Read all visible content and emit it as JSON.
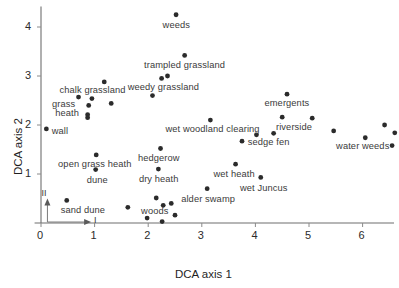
{
  "chart_data": {
    "type": "scatter",
    "title": "",
    "xlabel": "DCA axis 1",
    "ylabel": "DCA axis 2",
    "xlim": [
      -0.12,
      6.6
    ],
    "ylim": [
      -0.12,
      4.45
    ],
    "xticks": [
      0,
      1,
      2,
      3,
      4,
      5,
      6
    ],
    "xticklabels": [
      "0",
      "1",
      "2",
      "3",
      "4",
      "5",
      "6"
    ],
    "yticks": [
      1,
      2,
      3,
      4
    ],
    "yticklabels": [
      "1",
      "2",
      "3",
      "4"
    ],
    "grid": false,
    "legend": null,
    "marker": "circle",
    "marker_color": "#2b2b2b",
    "inset_axes": {
      "axis_i_label": "I",
      "axis_ii_label": "II"
    },
    "points": [
      {
        "x": 2.52,
        "y": 4.25,
        "label": "weeds"
      },
      {
        "x": 2.68,
        "y": 3.42,
        "label": "trampled grassland"
      },
      {
        "x": 2.25,
        "y": 2.95,
        "label": ""
      },
      {
        "x": 2.36,
        "y": 3.0,
        "label": "weedy grassland"
      },
      {
        "x": 2.08,
        "y": 2.6,
        "label": ""
      },
      {
        "x": 1.18,
        "y": 2.88,
        "label": ""
      },
      {
        "x": 0.7,
        "y": 2.57,
        "label": "chalk grassland"
      },
      {
        "x": 0.95,
        "y": 2.54,
        "label": ""
      },
      {
        "x": 1.31,
        "y": 2.44,
        "label": ""
      },
      {
        "x": 0.89,
        "y": 2.4,
        "label": "grass heath"
      },
      {
        "x": 0.87,
        "y": 2.21,
        "label": ""
      },
      {
        "x": 0.87,
        "y": 2.15,
        "label": ""
      },
      {
        "x": 0.1,
        "y": 1.92,
        "label": "wall"
      },
      {
        "x": 3.16,
        "y": 2.1,
        "label": "wet woodland clearing"
      },
      {
        "x": 4.59,
        "y": 2.63,
        "label": "emergents"
      },
      {
        "x": 4.5,
        "y": 2.16,
        "label": "riverside"
      },
      {
        "x": 5.06,
        "y": 2.14,
        "label": ""
      },
      {
        "x": 3.75,
        "y": 1.67,
        "label": ""
      },
      {
        "x": 4.02,
        "y": 1.8,
        "label": "sedge fen"
      },
      {
        "x": 4.34,
        "y": 1.83,
        "label": ""
      },
      {
        "x": 5.46,
        "y": 1.88,
        "label": ""
      },
      {
        "x": 6.05,
        "y": 1.74,
        "label": "water weeds"
      },
      {
        "x": 6.41,
        "y": 2.0,
        "label": ""
      },
      {
        "x": 6.6,
        "y": 1.84,
        "label": ""
      },
      {
        "x": 6.55,
        "y": 1.58,
        "label": ""
      },
      {
        "x": 2.23,
        "y": 1.52,
        "label": "hedgerow"
      },
      {
        "x": 1.03,
        "y": 1.39,
        "label": "open grass heath"
      },
      {
        "x": 1.02,
        "y": 1.09,
        "label": "dune"
      },
      {
        "x": 2.19,
        "y": 1.1,
        "label": "dry heath"
      },
      {
        "x": 3.63,
        "y": 1.2,
        "label": "wet heath"
      },
      {
        "x": 4.1,
        "y": 0.93,
        "label": "wet Juncus"
      },
      {
        "x": 3.1,
        "y": 0.7,
        "label": "alder swamp"
      },
      {
        "x": 0.48,
        "y": 0.46,
        "label": "sand dune"
      },
      {
        "x": 1.62,
        "y": 0.32,
        "label": ""
      },
      {
        "x": 2.15,
        "y": 0.51,
        "label": ""
      },
      {
        "x": 2.28,
        "y": 0.36,
        "label": ""
      },
      {
        "x": 2.43,
        "y": 0.4,
        "label": ""
      },
      {
        "x": 2.5,
        "y": 0.16,
        "label": "woods"
      },
      {
        "x": 2.26,
        "y": 0.03,
        "label": ""
      },
      {
        "x": 1.98,
        "y": 0.1,
        "label": ""
      }
    ],
    "point_labels": [
      {
        "text": "weeds",
        "x": 2.52,
        "y": 4.05,
        "anchor": "middle"
      },
      {
        "text": "trampled grassland",
        "x": 2.68,
        "y": 3.22,
        "anchor": "middle"
      },
      {
        "text": "weedy grassland",
        "x": 2.28,
        "y": 2.78,
        "anchor": "middle"
      },
      {
        "text": "chalk grassland",
        "x": 0.96,
        "y": 2.72,
        "anchor": "middle"
      },
      {
        "text": "grass",
        "x": 0.42,
        "y": 2.42,
        "anchor": "middle"
      },
      {
        "text": "heath",
        "x": 0.49,
        "y": 2.25,
        "anchor": "middle"
      },
      {
        "text": "wall",
        "x": 0.2,
        "y": 1.88,
        "anchor": "start"
      },
      {
        "text": "wet woodland clearing",
        "x": 3.2,
        "y": 1.92,
        "anchor": "middle"
      },
      {
        "text": "emergents",
        "x": 4.59,
        "y": 2.45,
        "anchor": "middle"
      },
      {
        "text": "riverside",
        "x": 4.72,
        "y": 1.97,
        "anchor": "middle"
      },
      {
        "text": "sedge fen",
        "x": 4.25,
        "y": 1.65,
        "anchor": "middle"
      },
      {
        "text": "water weeds",
        "x": 6.0,
        "y": 1.58,
        "anchor": "middle"
      },
      {
        "text": "hedgerow",
        "x": 2.2,
        "y": 1.33,
        "anchor": "middle"
      },
      {
        "text": "open grass heath",
        "x": 1.0,
        "y": 1.2,
        "anchor": "middle"
      },
      {
        "text": "dune",
        "x": 1.05,
        "y": 0.88,
        "anchor": "middle"
      },
      {
        "text": "dry heath",
        "x": 2.2,
        "y": 0.9,
        "anchor": "middle"
      },
      {
        "text": "wet heath",
        "x": 3.6,
        "y": 1.0,
        "anchor": "middle"
      },
      {
        "text": "wet Juncus",
        "x": 4.16,
        "y": 0.72,
        "anchor": "middle"
      },
      {
        "text": "alder swamp",
        "x": 3.12,
        "y": 0.5,
        "anchor": "middle"
      },
      {
        "text": "sand dune",
        "x": 0.78,
        "y": 0.27,
        "anchor": "middle"
      },
      {
        "text": "woods",
        "x": 2.12,
        "y": 0.24,
        "anchor": "middle"
      }
    ]
  },
  "axes": {
    "x_title": "DCA axis 1",
    "y_title": "DCA axis 2",
    "x_tick_labels": [
      "0",
      "1",
      "2",
      "3",
      "4",
      "5",
      "6"
    ],
    "y_tick_labels": [
      "1",
      "2",
      "3",
      "4"
    ],
    "inset_i": "I",
    "inset_ii": "II"
  }
}
